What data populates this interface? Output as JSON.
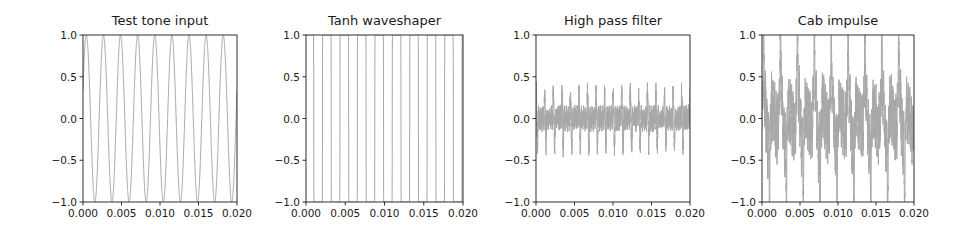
{
  "figure": {
    "width": 973,
    "height": 231,
    "line_color": "#a8a8a8",
    "axis_color": "#1a1a1a"
  },
  "chart_data": [
    {
      "type": "line",
      "title": "Test tone input",
      "xlabel": "",
      "ylabel": "",
      "xlim": [
        0.0,
        0.02
      ],
      "ylim": [
        -1.0,
        1.0
      ],
      "xticks": [
        "0.000",
        "0.005",
        "0.010",
        "0.015",
        "0.020"
      ],
      "yticks": [
        "1.0",
        "0.5",
        "0.0",
        "−0.5",
        "−1.0"
      ],
      "grid": false,
      "legend": null,
      "signal": {
        "kind": "sine",
        "frequency_hz": 450,
        "amplitude": 1.0,
        "cycles_visible": 9
      }
    },
    {
      "type": "line",
      "title": "Tanh waveshaper",
      "xlabel": "",
      "ylabel": "",
      "xlim": [
        0.0,
        0.02
      ],
      "ylim": [
        -1.0,
        1.0
      ],
      "xticks": [
        "0.000",
        "0.005",
        "0.010",
        "0.015",
        "0.020"
      ],
      "yticks": [
        "1.0",
        "0.5",
        "0.0",
        "−0.5",
        "−1.0"
      ],
      "grid": false,
      "legend": null,
      "signal": {
        "kind": "tanh_clipped_sine",
        "frequency_hz": 450,
        "drive": 40,
        "amplitude": 1.0
      }
    },
    {
      "type": "line",
      "title": "High pass filter",
      "xlabel": "",
      "ylabel": "",
      "xlim": [
        0.0,
        0.02
      ],
      "ylim": [
        -1.0,
        1.0
      ],
      "xticks": [
        "0.000",
        "0.005",
        "0.010",
        "0.015",
        "0.020"
      ],
      "yticks": [
        "1.0",
        "0.5",
        "0.0",
        "−0.5",
        "−1.0"
      ],
      "grid": false,
      "legend": null,
      "signal": {
        "kind": "highpass_spikes",
        "frequency_hz": 450,
        "peak_amplitude": 0.3,
        "noise_amplitude": 0.12
      }
    },
    {
      "type": "line",
      "title": "Cab impulse",
      "xlabel": "",
      "ylabel": "",
      "xlim": [
        0.0,
        0.02
      ],
      "ylim": [
        -1.0,
        1.0
      ],
      "xticks": [
        "0.000",
        "0.005",
        "0.010",
        "0.015",
        "0.020"
      ],
      "yticks": [
        "1.0",
        "0.5",
        "0.0",
        "−0.5",
        "−1.0"
      ],
      "grid": false,
      "legend": null,
      "signal": {
        "kind": "cab_response",
        "frequency_hz": 450,
        "peak_amplitude": 0.97,
        "body_amplitude": 0.55,
        "noise_amplitude": 0.2
      }
    }
  ],
  "panels": [
    {
      "title": "Test tone input",
      "axes": {
        "left": 83,
        "right": 237,
        "top": 35,
        "bottom": 202
      }
    },
    {
      "title": "Tanh waveshaper",
      "axes": {
        "left": 306,
        "right": 463,
        "top": 35,
        "bottom": 202
      }
    },
    {
      "title": "High pass filter",
      "axes": {
        "left": 536,
        "right": 690,
        "top": 35,
        "bottom": 202
      }
    },
    {
      "title": "Cab impulse",
      "axes": {
        "left": 762,
        "right": 914,
        "top": 35,
        "bottom": 202
      }
    }
  ]
}
